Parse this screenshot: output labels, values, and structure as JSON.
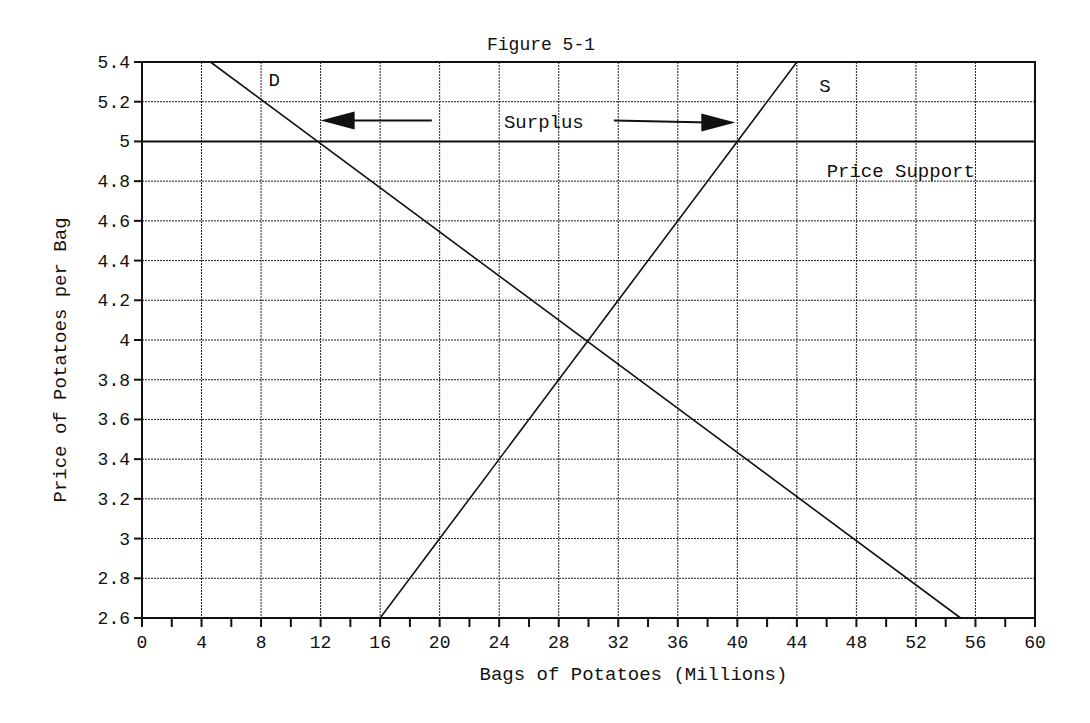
{
  "figure": {
    "title": "Figure 5-1"
  },
  "chart_data": {
    "type": "line",
    "title": "Figure 5-1",
    "xlabel": "Bags of Potatoes (Millions)",
    "ylabel": "Price of Potatoes per Bag",
    "xlim": [
      0,
      60
    ],
    "ylim": [
      2.6,
      5.4
    ],
    "x_ticks": [
      0,
      4,
      8,
      12,
      16,
      20,
      24,
      28,
      32,
      36,
      40,
      44,
      48,
      52,
      56,
      60
    ],
    "x_tick_labels": [
      "0",
      "4",
      "8",
      "12",
      "16",
      "20",
      "24",
      "28",
      "32",
      "36",
      "40",
      "44",
      "48",
      "52",
      "56",
      "60"
    ],
    "x_minor_ticks_every": 2,
    "y_ticks": [
      2.6,
      2.8,
      3.0,
      3.2,
      3.4,
      3.6,
      3.8,
      4.0,
      4.2,
      4.4,
      4.6,
      4.8,
      5.0,
      5.2,
      5.4
    ],
    "y_tick_labels": [
      "2.6",
      "2.8",
      "3",
      "3.2",
      "3.4",
      "3.6",
      "3.8",
      "4",
      "4.2",
      "4.4",
      "4.6",
      "4.8",
      "5",
      "5.2",
      "5.4"
    ],
    "grid": true,
    "series": [
      {
        "name": "D",
        "label": "D",
        "kind": "demand",
        "x": [
          4.6,
          55
        ],
        "y": [
          5.4,
          2.6
        ]
      },
      {
        "name": "S",
        "label": "S",
        "kind": "supply",
        "x": [
          16,
          44
        ],
        "y": [
          2.6,
          5.4
        ]
      },
      {
        "name": "Price Support",
        "label": "Price Support",
        "kind": "hline",
        "x": [
          0,
          60
        ],
        "y": [
          5.0,
          5.0
        ]
      }
    ],
    "annotations": [
      {
        "text": "D",
        "x": 8.5,
        "y": 5.28
      },
      {
        "text": "S",
        "x": 45.5,
        "y": 5.25
      },
      {
        "text": "Surplus",
        "x": 27,
        "y": 5.07,
        "arrow_left_to": 12,
        "arrow_right_to": 40
      },
      {
        "text": "Price Support",
        "x": 46,
        "y": 4.82
      }
    ],
    "equilibrium": {
      "x": 30,
      "y": 4.0
    },
    "surplus": {
      "price": 5.0,
      "quantity_demanded": 12,
      "quantity_supplied": 40
    }
  }
}
